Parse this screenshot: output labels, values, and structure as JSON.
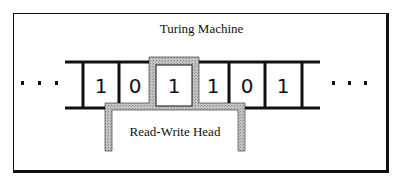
{
  "diagram": {
    "title": "Turing Machine",
    "head_label": "Read-Write Head",
    "ellipsis_left": "· · ·",
    "ellipsis_right": "· · ·",
    "tape_cells": [
      "1",
      "0",
      "1",
      "1",
      "0",
      "1"
    ],
    "head_position_index": 2,
    "colors": {
      "line": "#111111",
      "head_fill": "#b8b8b8",
      "background": "#ffffff"
    }
  }
}
